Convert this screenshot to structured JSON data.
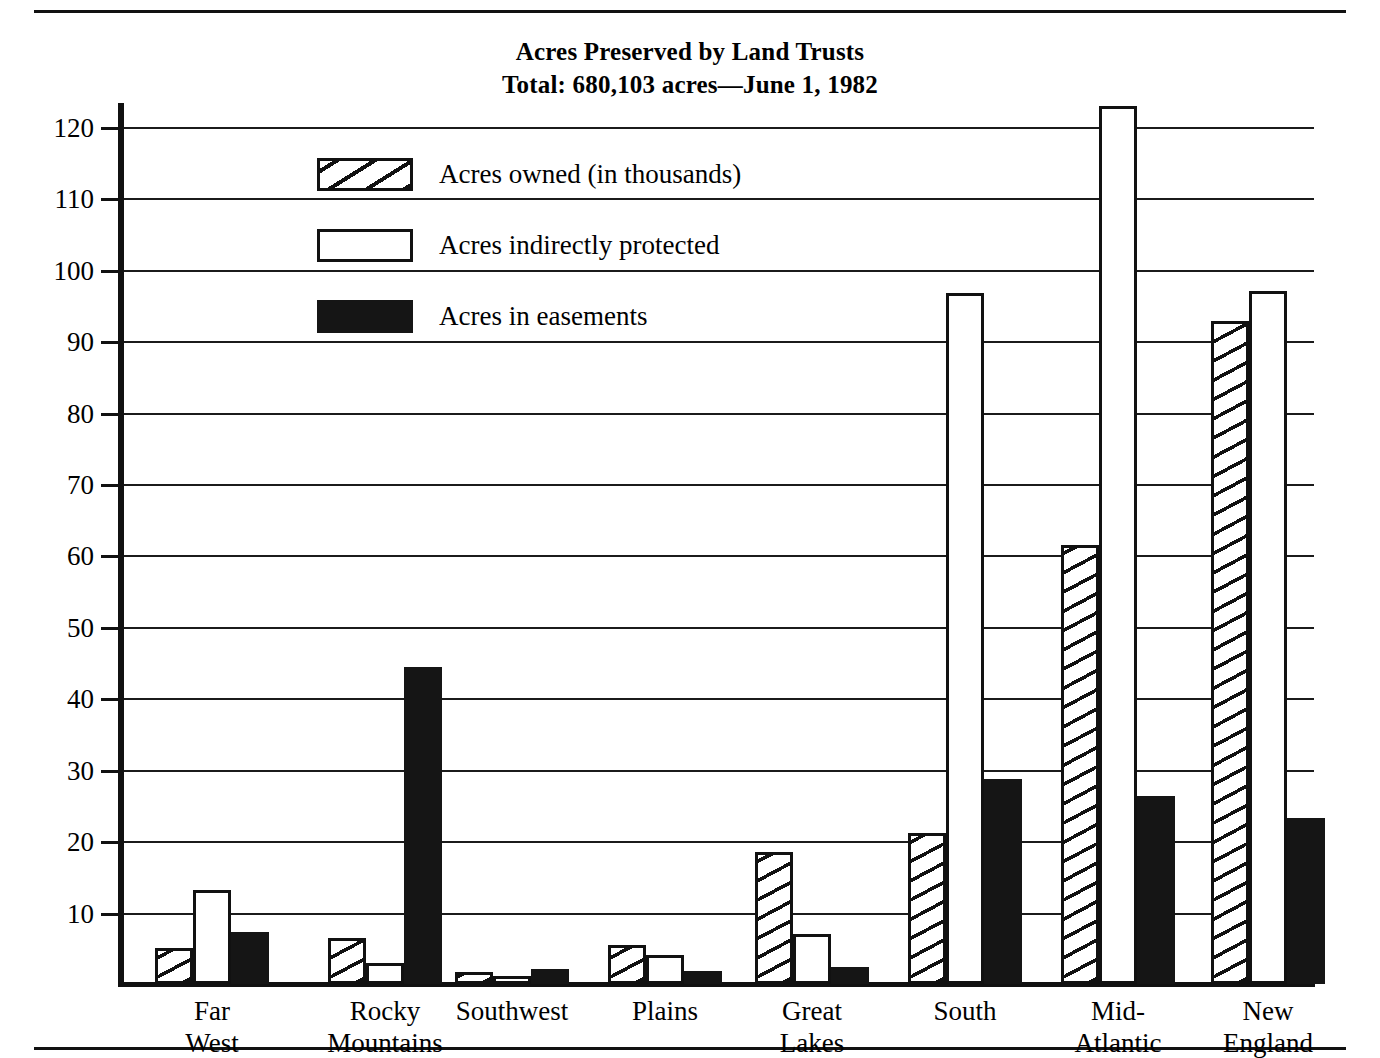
{
  "chart_data": {
    "type": "bar",
    "title": "Acres Preserved by Land Trusts",
    "subtitle": "Total: 680,103 acres—June 1, 1982",
    "xlabel": "",
    "ylabel": "",
    "ylim": [
      0,
      125
    ],
    "grid": true,
    "legend_position": "upper-left-inside",
    "ytick_labels": [
      "120",
      "110",
      "100",
      "90",
      "80",
      "70",
      "60",
      "50",
      "40",
      "30",
      "20",
      "10"
    ],
    "yticks": [
      120,
      110,
      100,
      90,
      80,
      70,
      60,
      50,
      40,
      30,
      20,
      10
    ],
    "categories": [
      "Far\nWest",
      "Rocky\nMountains",
      "Southwest",
      "Plains",
      "Great\nLakes",
      "South",
      "Mid-\nAtlantic",
      "New\nEngland"
    ],
    "category_lines": [
      [
        "Far",
        "West"
      ],
      [
        "Rocky",
        "Mountains"
      ],
      [
        "Southwest",
        ""
      ],
      [
        "Plains",
        ""
      ],
      [
        "Great",
        "Lakes"
      ],
      [
        "South",
        ""
      ],
      [
        "Mid-",
        "Atlantic"
      ],
      [
        "New",
        "England"
      ]
    ],
    "series": [
      {
        "name": "Acres owned (in thousands)",
        "pattern": "diagonal-hatch",
        "values": [
          5.1,
          6.4,
          1.7,
          5.5,
          18.5,
          21.2,
          61.5,
          92.8
        ]
      },
      {
        "name": "Acres indirectly protected",
        "pattern": "open",
        "values": [
          13.2,
          3.0,
          1.1,
          4.1,
          7.0,
          96.7,
          123.0,
          97.0
        ]
      },
      {
        "name": "Acres in easements",
        "pattern": "solid-black",
        "values": [
          7.3,
          44.4,
          2.1,
          1.8,
          2.4,
          28.7,
          26.3,
          23.2
        ]
      }
    ]
  },
  "colors": {
    "ink": "#111111",
    "paper": "#ffffff"
  }
}
